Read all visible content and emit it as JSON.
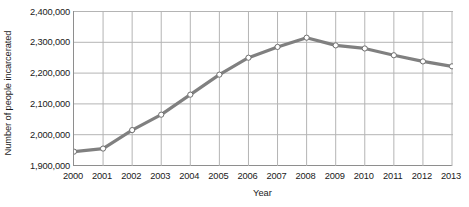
{
  "chart_data": {
    "type": "line",
    "title": "",
    "subtitle": "",
    "xlabel": "Year",
    "ylabel": "Number of people incarcerated",
    "x": [
      2000,
      2001,
      2002,
      2003,
      2004,
      2005,
      2006,
      2007,
      2008,
      2009,
      2010,
      2011,
      2012,
      2013
    ],
    "x_tick_labels": [
      "2000",
      "2001",
      "2002",
      "2003",
      "2004",
      "2005",
      "2006",
      "2007",
      "2008",
      "2009",
      "2010",
      "2011",
      "2012",
      "2013"
    ],
    "values": [
      1945000,
      1955000,
      2015000,
      2065000,
      2130000,
      2195000,
      2250000,
      2285000,
      2315000,
      2290000,
      2280000,
      2258000,
      2238000,
      2222000
    ],
    "y_tick_labels": [
      "2,400,000",
      "2,300,000",
      "2,200,000",
      "2,100,000",
      "2,000,000",
      "1,900,000"
    ],
    "y_ticks": [
      2400000,
      2300000,
      2200000,
      2100000,
      2000000,
      1900000
    ],
    "ylim": [
      1900000,
      2400000
    ],
    "xlim": [
      2000,
      2013
    ],
    "grid": true,
    "grid_axis": "both",
    "legend": null,
    "series": [
      {
        "name": "Number of people incarcerated",
        "values": [
          1945000,
          1955000,
          2015000,
          2065000,
          2130000,
          2195000,
          2250000,
          2285000,
          2315000,
          2290000,
          2280000,
          2258000,
          2238000,
          2222000
        ]
      }
    ],
    "colors": {
      "line": "#808080",
      "marker_fill": "#ffffff",
      "marker_stroke": "#6e6e6e",
      "grid": "#b4b4b4",
      "axis": "#8e8e8e",
      "text": "#1a1a1a",
      "background": "#ffffff"
    }
  }
}
